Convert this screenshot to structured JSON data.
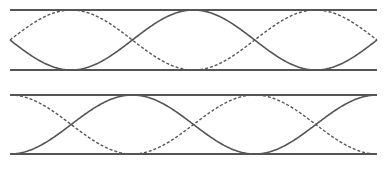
{
  "canvas": {
    "width": 389,
    "height": 170,
    "background": "#ffffff"
  },
  "colors": {
    "line": "#555555"
  },
  "x_range": [
    10,
    377
  ],
  "panels": [
    {
      "name": "panel-top",
      "rail_top_y": 10,
      "rail_bottom_y": 70,
      "waves": [
        {
          "style": "solid",
          "cycles": 1.5,
          "phase": "start-middle-going-down"
        },
        {
          "style": "dashed",
          "cycles": 1.5,
          "phase": "start-middle-going-up"
        }
      ]
    },
    {
      "name": "panel-bottom",
      "rail_top_y": 95,
      "rail_bottom_y": 154,
      "waves": [
        {
          "style": "solid",
          "cycles": 1.5,
          "phase": "start-bottom"
        },
        {
          "style": "dashed",
          "cycles": 1.5,
          "phase": "start-top"
        }
      ]
    }
  ]
}
